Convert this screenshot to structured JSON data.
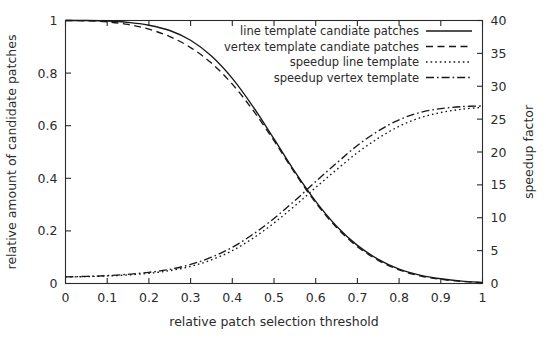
{
  "chart_data": {
    "type": "line",
    "title": "",
    "xlabel": "relative patch selection threshold",
    "ylabel": "relative amount of candidate patches",
    "y2label": "speedup factor",
    "xlim": [
      0,
      1
    ],
    "ylim": [
      0,
      1
    ],
    "y2lim": [
      0,
      40
    ],
    "grid": false,
    "legend_position": "top-right",
    "xticks": [
      "0",
      "0.1",
      "0.2",
      "0.3",
      "0.4",
      "0.5",
      "0.6",
      "0.7",
      "0.8",
      "0.9",
      "1"
    ],
    "xtick_values": [
      0,
      0.1,
      0.2,
      0.3,
      0.4,
      0.5,
      0.6,
      0.7,
      0.8,
      0.9,
      1
    ],
    "yticks": [
      "0",
      "0.2",
      "0.4",
      "0.6",
      "0.8",
      "1"
    ],
    "ytick_values": [
      0,
      0.2,
      0.4,
      0.6,
      0.8,
      1
    ],
    "y2ticks": [
      "0",
      "5",
      "10",
      "15",
      "20",
      "25",
      "30",
      "35",
      "40"
    ],
    "y2tick_values": [
      0,
      5,
      10,
      15,
      20,
      25,
      30,
      35,
      40
    ],
    "x": [
      0,
      0.05,
      0.1,
      0.15,
      0.2,
      0.25,
      0.3,
      0.35,
      0.4,
      0.45,
      0.5,
      0.55,
      0.6,
      0.65,
      0.7,
      0.75,
      0.8,
      0.85,
      0.9,
      0.95,
      1
    ],
    "series": [
      {
        "name": "line template candiate patches",
        "axis": "left",
        "style": "solid",
        "values": [
          1.0,
          1.0,
          0.998,
          0.993,
          0.982,
          0.962,
          0.925,
          0.865,
          0.78,
          0.672,
          0.55,
          0.425,
          0.312,
          0.218,
          0.145,
          0.092,
          0.055,
          0.032,
          0.018,
          0.009,
          0.004
        ]
      },
      {
        "name": "vertex template candiate patches",
        "axis": "left",
        "style": "dashed",
        "values": [
          1.0,
          0.999,
          0.995,
          0.985,
          0.967,
          0.939,
          0.897,
          0.838,
          0.758,
          0.658,
          0.543,
          0.42,
          0.307,
          0.213,
          0.14,
          0.088,
          0.052,
          0.029,
          0.016,
          0.008,
          0.003
        ]
      },
      {
        "name": "speedup line template",
        "axis": "right",
        "style": "dotted",
        "values": [
          1.0,
          1.05,
          1.15,
          1.3,
          1.55,
          1.95,
          2.6,
          3.6,
          5.0,
          6.9,
          9.2,
          11.8,
          14.6,
          17.3,
          19.9,
          22.1,
          23.9,
          25.2,
          26.0,
          26.5,
          26.8
        ]
      },
      {
        "name": "speedup vertex template",
        "axis": "right",
        "style": "dashdot",
        "values": [
          1.0,
          1.08,
          1.2,
          1.4,
          1.7,
          2.15,
          2.9,
          4.0,
          5.5,
          7.5,
          9.9,
          12.6,
          15.5,
          18.3,
          21.0,
          23.2,
          24.9,
          26.0,
          26.6,
          26.9,
          27.0
        ]
      }
    ],
    "legend": [
      {
        "label": "line template candiate patches",
        "style": "solid"
      },
      {
        "label": "vertex template candiate patches",
        "style": "dashed"
      },
      {
        "label": "speedup line template",
        "style": "dotted"
      },
      {
        "label": "speedup vertex template",
        "style": "dashdot"
      }
    ]
  },
  "colors": {
    "axis": "#2b2b2b",
    "series": "#181818",
    "background": "#ffffff"
  }
}
